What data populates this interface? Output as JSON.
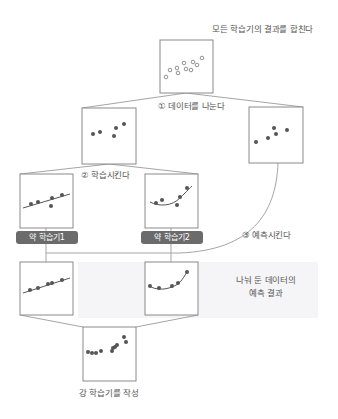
{
  "diagram": {
    "steps": {
      "merge_label": "모든 학습기의 결과를 합친다",
      "step1_label": "① 데이터를 나눈다",
      "step2_label": "② 학습시킨다",
      "step3_label": "③ 예측시킨다",
      "prediction_label_line1": "나눠 둔 데이터의",
      "prediction_label_line2": "예측 결과",
      "final_label": "강 학습기를 작성"
    },
    "weak_learners": [
      {
        "label": "약 학습기1",
        "model": "linear"
      },
      {
        "label": "약 학습기2",
        "model": "curve"
      }
    ],
    "colors": {
      "line": "#9a9a9a",
      "box_border": "#8a8a8a",
      "dot": "#555555",
      "tag_bg": "#6b6b6b",
      "tag_text": "#ffffff",
      "shade": "#eeeef2"
    }
  }
}
